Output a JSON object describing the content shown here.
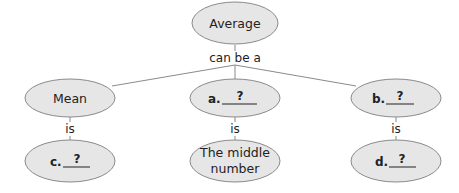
{
  "diagram": {
    "root": {
      "label": "Average"
    },
    "root_link_label": "can be a",
    "children": [
      {
        "label": "Mean",
        "link_label": "is",
        "child": {
          "blank_letter": "c.",
          "blank_text": "?"
        }
      },
      {
        "blank_letter": "a.",
        "blank_text": "?",
        "link_label": "is",
        "child": {
          "label_line1": "The middle",
          "label_line2": "number"
        }
      },
      {
        "blank_letter": "b.",
        "blank_text": "?",
        "link_label": "is",
        "child": {
          "blank_letter": "d.",
          "blank_text": "?"
        }
      }
    ]
  }
}
